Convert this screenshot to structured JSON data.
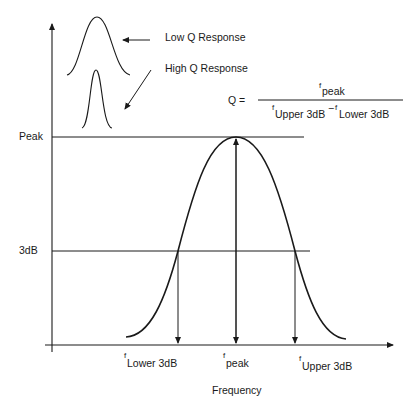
{
  "diagram": {
    "y_axis": {
      "levels": [
        {
          "id": "peak",
          "label": "Peak"
        },
        {
          "id": "3db",
          "label": "3dB"
        }
      ]
    },
    "x_axis": {
      "label": "Frequency",
      "markers": [
        {
          "id": "lower",
          "f": "f",
          "sub": "Lower 3dB"
        },
        {
          "id": "peak",
          "f": "f",
          "sub": "peak"
        },
        {
          "id": "upper",
          "f": "f",
          "sub": "Upper 3dB"
        }
      ]
    },
    "legend": {
      "low_q": "Low Q Response",
      "high_q": "High Q Response"
    },
    "formula": {
      "lhs": "Q =",
      "numerator_f": "f",
      "numerator_sub": "peak",
      "denominator_f1": "f",
      "denominator_sub1": "Upper 3dB",
      "minus": "−",
      "denominator_f2": "f",
      "denominator_sub2": "Lower 3dB"
    },
    "colors": {
      "line": "#1a1a1a",
      "background": "#ffffff"
    }
  }
}
